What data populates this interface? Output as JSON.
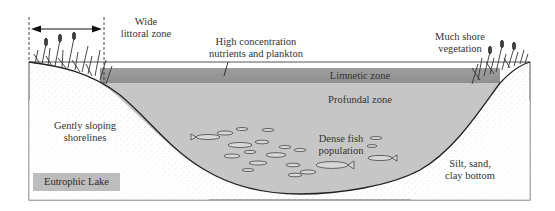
{
  "diagram": {
    "title": "Eutrophic  Lake",
    "colors": {
      "limnetic_band": "#9a9a9a",
      "profundal_water": "#c4c4c4",
      "shore_sediment": "#ffffff",
      "frame": "#555555",
      "label_box": "#bdbdbd"
    },
    "labels": {
      "littoral": [
        "Wide",
        "littoral zone"
      ],
      "nutrients": [
        "High concentration",
        "nutrients and plankton"
      ],
      "shore_vegetation": [
        "Much shore",
        "vegetation"
      ],
      "limnetic": "Limnetic zone",
      "profundal": "Profundal  zone",
      "shorelines": [
        "Gently sloping",
        "shorelines"
      ],
      "fish": [
        "Dense fish",
        "population"
      ],
      "bottom": [
        "Silt, sand,",
        "clay bottom"
      ]
    }
  }
}
